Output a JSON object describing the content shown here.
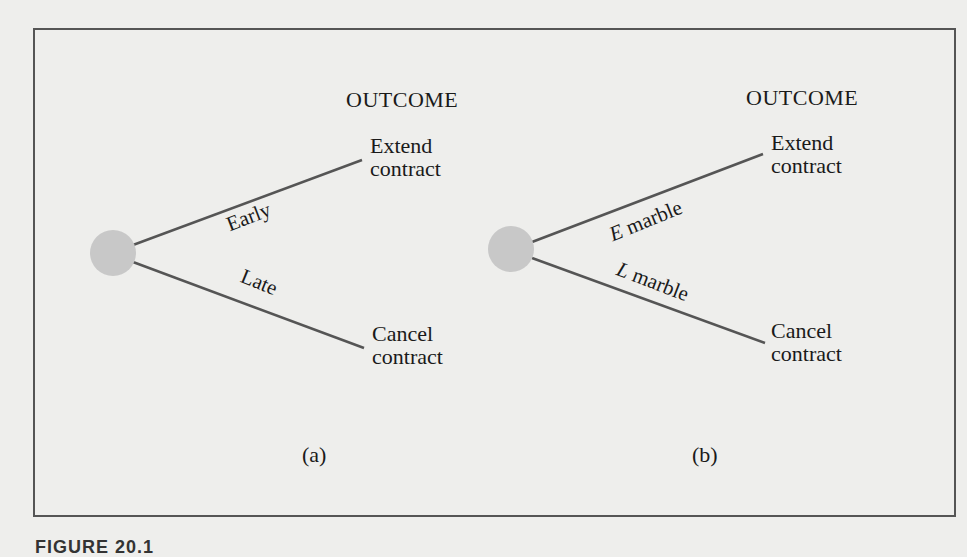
{
  "figure": {
    "caption": "FIGURE 20.1",
    "colors": {
      "node": "#c8c8c8",
      "line": "#555555",
      "background": "#eeeeec",
      "border": "#555555"
    }
  },
  "panels": [
    {
      "label": "(a)",
      "header": "OUTCOME",
      "branches": [
        {
          "label": "Early",
          "outcome_line1": "Extend",
          "outcome_line2": "contract"
        },
        {
          "label": "Late",
          "outcome_line1": "Cancel",
          "outcome_line2": "contract"
        }
      ]
    },
    {
      "label": "(b)",
      "header": "OUTCOME",
      "branches": [
        {
          "label_var": "E",
          "label": " marble",
          "outcome_line1": "Extend",
          "outcome_line2": "contract"
        },
        {
          "label_var": "L",
          "label": " marble",
          "outcome_line1": "Cancel",
          "outcome_line2": "contract"
        }
      ]
    }
  ]
}
